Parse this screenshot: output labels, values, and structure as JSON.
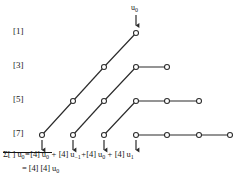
{
  "figure": {
    "type": "lattice-diagram",
    "top_input": {
      "symbol": "u",
      "subscript": "0",
      "arrow": "down-arrow-icon"
    },
    "row_labels": [
      {
        "text": "[1]",
        "y": 31
      },
      {
        "text": "[3]",
        "y": 65
      },
      {
        "text": "[5]",
        "y": 99
      },
      {
        "text": "[7]",
        "y": 133
      }
    ],
    "rows": [
      {
        "label": "[1]",
        "y": 33,
        "nodes_x": [
          136
        ],
        "diagonal_from": null,
        "horizontal_to": []
      },
      {
        "label": "[3]",
        "y": 67,
        "nodes_x": [
          104,
          136,
          167
        ],
        "horizontal_segment": [
          136,
          167
        ]
      },
      {
        "label": "[5]",
        "y": 101,
        "nodes_x": [
          73,
          104,
          136,
          167,
          199
        ],
        "horizontal_segment": [
          136,
          199
        ]
      },
      {
        "label": "[7]",
        "y": 135,
        "nodes_x": [
          42,
          73,
          104,
          136,
          167,
          199,
          230
        ],
        "horizontal_segment": [
          136,
          230
        ]
      }
    ],
    "output_arrows_x": [
      42,
      73,
      104,
      136
    ],
    "grid": false
  },
  "formula": {
    "line1": {
      "sum_symbol": "Σ",
      "brackets": "[ ]",
      "lhs_term": "u",
      "lhs_sub": "0",
      "equals": "=",
      "terms": [
        {
          "coef": "[4]",
          "var": "u",
          "sub": "0"
        },
        {
          "coef": "[4]",
          "var": "u",
          "sub": "−1"
        },
        {
          "coef": "[4]",
          "var": "u",
          "sub": "0"
        },
        {
          "coef": "[4]",
          "var": "u",
          "sub": "1"
        }
      ],
      "plus": "+",
      "full_text": "Σ [ ] u0 = [4] u0 + [4] u−1 + [4] u0 + [4] u1"
    },
    "line2": {
      "equals": "=",
      "coef1": "[4]",
      "coef2": "[4]",
      "var": "u",
      "sub": "0",
      "full_text": "= [4] [4] u0"
    },
    "has_overline": true
  },
  "colors": {
    "ink": "#141414",
    "line": "#2b2b2b",
    "background": "#ffffff",
    "node_fill": "#ffffff"
  }
}
